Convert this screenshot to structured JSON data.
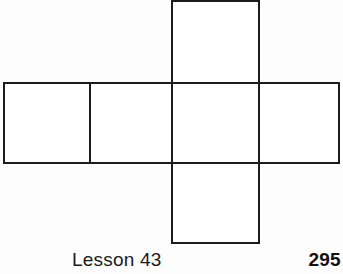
{
  "page": {
    "background_color": "#fdfdfd",
    "line_color": "#1c1c1c",
    "fill_color": "#ffffff"
  },
  "figure": {
    "name": "cube-net-cross-diagram",
    "square_count": 5,
    "squares": [
      {
        "id": "top",
        "x": 172,
        "y": 1,
        "width": 87,
        "height": 82
      },
      {
        "id": "row-left",
        "x": 4,
        "y": 83,
        "width": 86,
        "height": 80
      },
      {
        "id": "row-midleft",
        "x": 90,
        "y": 83,
        "width": 82,
        "height": 80
      },
      {
        "id": "row-center",
        "x": 172,
        "y": 83,
        "width": 87,
        "height": 80
      },
      {
        "id": "row-right",
        "x": 259,
        "y": 83,
        "width": 80,
        "height": 80
      },
      {
        "id": "bottom",
        "x": 172,
        "y": 163,
        "width": 87,
        "height": 80
      }
    ],
    "stroke_width": 2.4
  },
  "footer": {
    "lesson_label": "Lesson 43",
    "page_number": "295"
  }
}
